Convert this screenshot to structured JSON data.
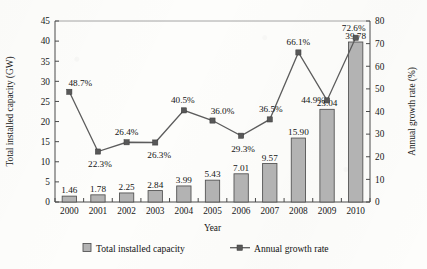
{
  "chart_data": {
    "type": "bar",
    "title": "",
    "subtitle": "",
    "xlabel": "Year",
    "ylabel": "Total installed capacity (GW)",
    "y2label": "Annual growth rate (%)",
    "categories": [
      "2000",
      "2001",
      "2002",
      "2003",
      "2004",
      "2005",
      "2006",
      "2007",
      "2008",
      "2009",
      "2010"
    ],
    "ylim": [
      0,
      45
    ],
    "yticks": [
      0,
      5,
      10,
      15,
      20,
      25,
      30,
      35,
      40,
      45
    ],
    "y2lim": [
      0,
      80
    ],
    "y2ticks": [
      0,
      10,
      20,
      30,
      40,
      50,
      60,
      70,
      80
    ],
    "grid": false,
    "legend_position": "bottom",
    "series": [
      {
        "name": "Total installed capacity",
        "type": "bar",
        "axis": "left",
        "unit": "GW",
        "values": [
          1.46,
          1.78,
          2.25,
          2.84,
          3.99,
          5.43,
          7.01,
          9.57,
          15.9,
          23.04,
          39.78
        ],
        "labels": [
          "1.46",
          "1.78",
          "2.25",
          "2.84",
          "3.99",
          "5.43",
          "7.01",
          "9.57",
          "15.90",
          "23.04",
          "39.78"
        ],
        "color": "#b3b3b3"
      },
      {
        "name": "Annual growth rate",
        "type": "line",
        "axis": "right",
        "unit": "%",
        "values": [
          48.7,
          22.3,
          26.4,
          26.3,
          40.5,
          36.0,
          29.3,
          36.5,
          66.1,
          44.9,
          72.6
        ],
        "labels": [
          "48.7%",
          "22.3%",
          "26.4%",
          "26.3%",
          "40.5%",
          "36.0%",
          "29.3%",
          "36.5%",
          "66.1%",
          "44.9%",
          "72.6%"
        ],
        "color": "#5c5c5c"
      }
    ]
  },
  "legend": {
    "items": [
      {
        "label": "Total installed capacity"
      },
      {
        "label": "Annual growth rate"
      }
    ]
  },
  "colors": {
    "bar_fill": "#b3b3b3",
    "bar_stroke": "#4e4e4e",
    "line": "#5c5c5c",
    "axis": "#4a4a4a",
    "text": "#131313",
    "background": "#fdfdfb"
  }
}
